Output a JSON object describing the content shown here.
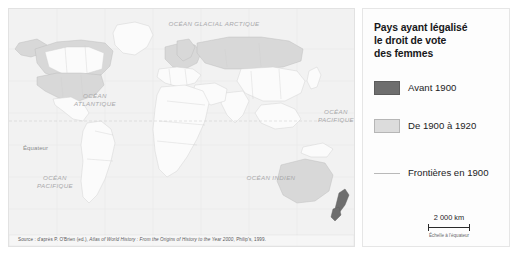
{
  "map": {
    "title": "Pays ayant légalisé le droit de vote des femmes",
    "source": "Source : d'après P. O'Brien (ed.), ",
    "source_italic": "Atlas of World History : From the Origins of History to the Year 2000",
    "source_tail": ", Philip's, 1999.",
    "labels": {
      "arctic_ocean": "OCÉAN GLACIAL ARCTIQUE",
      "atlantic_ocean": "OCÉAN\nATLANTIQUE",
      "pacific_ocean_east": "OCÉAN\nPACIFIQUE",
      "pacific_ocean_west": "OCÉAN\nPACIFIQUE",
      "indian_ocean": "OCÉAN INDIEN",
      "equator": "Équateur"
    },
    "colors": {
      "ocean": "#f2f2f2",
      "land_none": "#fbfbfb",
      "land_before_1900": "#6e6e6e",
      "land_1900_1920": "#d8d8d8",
      "border_1900": "#c4c4c4"
    },
    "countries_before_1900": [
      "Nouvelle-Zélande"
    ],
    "countries_1900_1920": [
      "Canada",
      "États-Unis",
      "Norvège",
      "Suède",
      "Danemark",
      "Finlande",
      "Russie",
      "Allemagne",
      "Pologne",
      "Autriche",
      "Pays-Bas",
      "Royaume-Uni",
      "Australie"
    ]
  },
  "legend": {
    "title": "Pays ayant légalisé le droit de vote des femmes",
    "title_lines": [
      "Pays ayant légalisé",
      "le droit de vote",
      "des femmes"
    ],
    "entries": [
      {
        "label": "Avant 1900",
        "swatch": "dark",
        "color": "#6e6e6e"
      },
      {
        "label": "De 1900 à 1920",
        "swatch": "light",
        "color": "#dcdcdc"
      },
      {
        "label": "Frontières en 1900",
        "swatch": "line",
        "color": "#b9b9b9"
      }
    ],
    "scale": {
      "value": "2 000 km",
      "caption": "Échelle à l'équateur"
    }
  }
}
